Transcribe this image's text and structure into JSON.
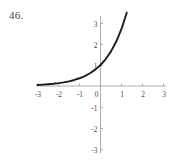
{
  "figure": {
    "problem_number": "46.",
    "background_color": "#ffffff"
  },
  "chart_data": {
    "type": "line",
    "title": "",
    "subtitle": "",
    "xlabel": "",
    "ylabel": "",
    "xlim": [
      -3.25,
      3.25
    ],
    "ylim": [
      -3.3,
      3.4
    ],
    "xticks": [
      -3,
      -2,
      -1,
      0,
      1,
      2,
      3
    ],
    "xtick_labels": [
      "-3",
      "-2",
      "-1",
      "0",
      "1",
      "2",
      "3"
    ],
    "yticks": [
      3,
      2,
      1,
      -1,
      -2,
      -3
    ],
    "ytick_labels": [
      "3",
      "2",
      "1",
      "-1",
      "-2",
      "-3"
    ],
    "origin_label": "0",
    "grid": false,
    "legend": null,
    "annotations": [],
    "series": [
      {
        "name": "exponential-curve",
        "color": "#1c1c1c",
        "line_width": 1.9,
        "description": "increasing exponential curve, horizontal asymptote at y = 0, y-intercept at (0, 1)",
        "x": [
          -3.0,
          -2.75,
          -2.5,
          -2.25,
          -2.0,
          -1.75,
          -1.5,
          -1.25,
          -1.0,
          -0.75,
          -0.5,
          -0.25,
          0.0,
          0.25,
          0.5,
          0.75,
          1.0,
          1.25
        ],
        "y": [
          0.05,
          0.064,
          0.082,
          0.105,
          0.135,
          0.174,
          0.223,
          0.287,
          0.368,
          0.472,
          0.607,
          0.779,
          1.0,
          1.284,
          1.649,
          2.117,
          2.718,
          3.49
        ]
      }
    ],
    "axes": {
      "x_axis_color": "#9a9a9a",
      "y_axis_color": "#9a9a9a",
      "x_axis_range_drawn": [
        -3.25,
        3.25
      ],
      "y_axis_range_drawn": [
        -3.3,
        3.4
      ]
    }
  }
}
